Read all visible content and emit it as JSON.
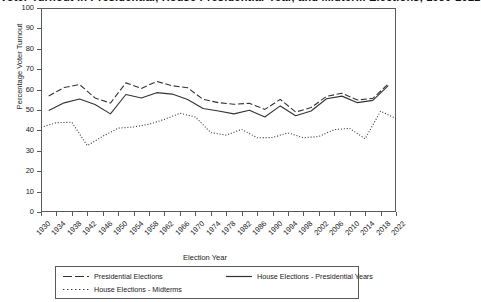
{
  "chart_data": {
    "type": "line",
    "title": "Voter Turnout in Presidential, House Presidential-Year, and Midterm Elections, 1930-2022",
    "xlabel": "Election Year",
    "ylabel": "Percentage Voter Turnout",
    "ylim": [
      0,
      100
    ],
    "ytick_step": 10,
    "yticks": [
      0,
      10,
      20,
      30,
      40,
      50,
      60,
      70,
      80,
      90,
      100
    ],
    "xlim": [
      1930,
      2022
    ],
    "xticks": [
      1930,
      1934,
      1938,
      1942,
      1946,
      1950,
      1954,
      1958,
      1962,
      1966,
      1970,
      1974,
      1978,
      1982,
      1986,
      1990,
      1994,
      1998,
      2002,
      2006,
      2010,
      2014,
      2018,
      2022
    ],
    "grid": false,
    "legend_position": "below-plot",
    "series": [
      {
        "name": "Presidential Elections",
        "style": "dashed",
        "color": "#333333",
        "x": [
          1932,
          1936,
          1940,
          1944,
          1948,
          1952,
          1956,
          1960,
          1964,
          1968,
          1972,
          1976,
          1980,
          1984,
          1988,
          1992,
          1996,
          2000,
          2004,
          2008,
          2012,
          2016,
          2020
        ],
        "values": [
          56.9,
          61.0,
          62.5,
          55.9,
          53.4,
          63.3,
          60.6,
          64.0,
          61.9,
          60.9,
          55.2,
          53.6,
          52.8,
          53.3,
          50.3,
          55.2,
          49.0,
          51.2,
          56.7,
          58.2,
          54.9,
          55.7,
          62.8
        ]
      },
      {
        "name": "House Elections - Presidential Years",
        "style": "solid",
        "color": "#333333",
        "x": [
          1932,
          1936,
          1940,
          1944,
          1948,
          1952,
          1956,
          1960,
          1964,
          1968,
          1972,
          1976,
          1980,
          1984,
          1988,
          1992,
          1996,
          2000,
          2004,
          2008,
          2012,
          2016,
          2020
        ],
        "values": [
          49.7,
          53.5,
          55.4,
          52.7,
          48.1,
          57.6,
          55.9,
          58.5,
          57.8,
          55.1,
          50.7,
          49.5,
          48.1,
          49.9,
          46.6,
          52.0,
          47.2,
          49.5,
          55.5,
          56.8,
          53.6,
          54.7,
          61.9
        ]
      },
      {
        "name": "House Elections - Midterms",
        "style": "dotted",
        "color": "#333333",
        "x": [
          1930,
          1934,
          1938,
          1942,
          1946,
          1950,
          1954,
          1958,
          1962,
          1966,
          1970,
          1974,
          1978,
          1982,
          1986,
          1990,
          1994,
          1998,
          2002,
          2006,
          2010,
          2014,
          2018,
          2022
        ],
        "values": [
          41.5,
          43.8,
          44.0,
          32.5,
          37.1,
          41.1,
          41.7,
          43.0,
          45.4,
          48.4,
          46.6,
          38.9,
          37.7,
          40.5,
          36.4,
          36.5,
          38.8,
          36.4,
          37.0,
          40.4,
          41.0,
          35.9,
          49.4,
          45.8
        ]
      }
    ]
  },
  "legend": {
    "entries": [
      {
        "label": "Presidential Elections",
        "style": "dashed"
      },
      {
        "label": "House Elections - Presidential Years",
        "style": "solid"
      },
      {
        "label": "House Elections - Midterms",
        "style": "dotted"
      }
    ]
  }
}
